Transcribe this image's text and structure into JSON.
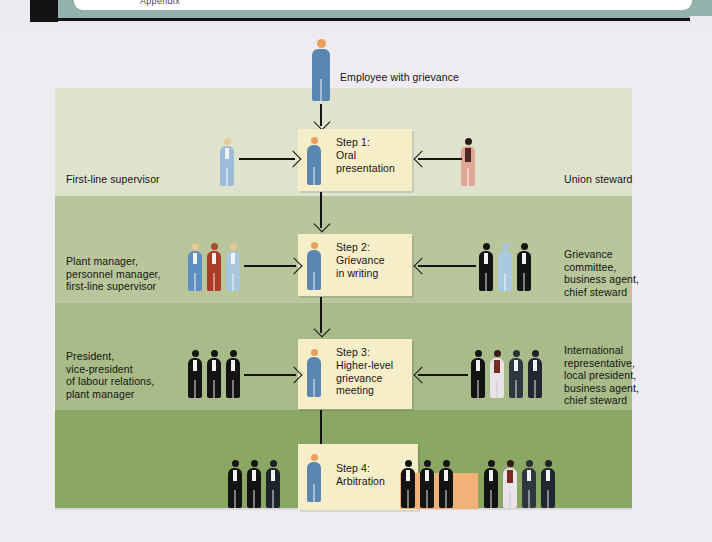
{
  "window": {
    "tab_text": "Appendix"
  },
  "diagram": {
    "title_employee": "Employee with grievance",
    "steps": [
      {
        "id": "step1",
        "label": "Step 1:\nOral\npresentation"
      },
      {
        "id": "step2",
        "label": "Step 2:\nGrievance\nin writing"
      },
      {
        "id": "step3",
        "label": "Step 3:\nHigher-level\ngrievance\nmeeting"
      },
      {
        "id": "step4",
        "label": "Step 4:\nArbitration"
      }
    ],
    "management_side": [
      {
        "row": 1,
        "label": "First-line supervisor"
      },
      {
        "row": 2,
        "label": "Plant manager,\npersonnel manager,\nfirst-line supervisor"
      },
      {
        "row": 3,
        "label": "President,\nvice-president\nof labour relations,\nplant manager"
      }
    ],
    "union_side": [
      {
        "row": 1,
        "label": "Union steward"
      },
      {
        "row": 2,
        "label": "Grievance\ncommittee,\nbusiness agent,\nchief steward"
      },
      {
        "row": 3,
        "label": "International\nrepresentative,\nlocal president,\nbusiness agent,\nchief steward"
      }
    ],
    "colors": {
      "band1": "#dfe2cd",
      "band2": "#b9c59a",
      "band3": "#a9bb88",
      "band4": "#8aa763",
      "step_box": "#f6eec9",
      "arbitration_table": "#f2b277",
      "page_background": "#eeecf1",
      "employee_figure": "#5a86b2",
      "union_steward_figure": "#e0a894",
      "arrow": "#131313"
    }
  }
}
